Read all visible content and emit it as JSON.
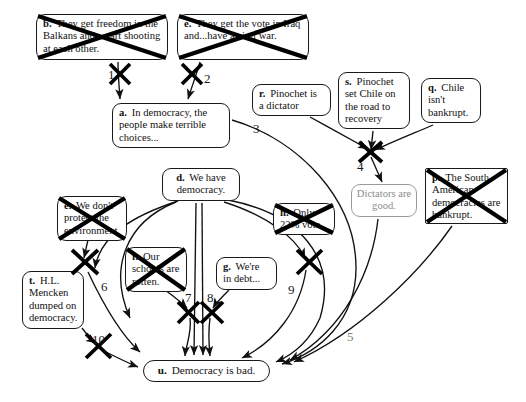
{
  "diagram": {
    "canvas": {
      "width": 526,
      "height": 402
    },
    "colors": {
      "ink": "#111111",
      "line": "#1a1a1a",
      "muted": "#8c8c8c",
      "background": "#ffffff"
    },
    "nodes": [
      {
        "id": "b",
        "label": "b.",
        "text": "They get freedom in the Balkans and...start shooting at each other.",
        "shape": "rounded",
        "refuted": true,
        "muted": false,
        "x": 36,
        "y": 14,
        "w": 132,
        "h": 46,
        "font": 10.6
      },
      {
        "id": "e_top",
        "label": "e.",
        "text": "They get the vote in Iraq and...have a civil war.",
        "shape": "rounded",
        "refuted": true,
        "muted": false,
        "x": 177,
        "y": 14,
        "w": 132,
        "h": 46,
        "font": 10.6
      },
      {
        "id": "a",
        "label": "a.",
        "text": "In democracy, the people make terrible choices...",
        "shape": "rounded",
        "refuted": false,
        "muted": false,
        "x": 112,
        "y": 103,
        "w": 118,
        "h": 45,
        "font": 10.6
      },
      {
        "id": "r",
        "label": "r.",
        "text": "Pinochet is a dictator",
        "shape": "rounded",
        "refuted": false,
        "muted": false,
        "x": 252,
        "y": 84,
        "w": 79,
        "h": 32,
        "font": 10.6
      },
      {
        "id": "s",
        "label": "s.",
        "text": "Pinochet set Chile on the road to recovery",
        "shape": "rounded",
        "refuted": false,
        "muted": false,
        "x": 338,
        "y": 72,
        "w": 72,
        "h": 57,
        "font": 10.6
      },
      {
        "id": "q",
        "label": "q.",
        "text": "Chile isn't bankrupt.",
        "shape": "rounded",
        "refuted": false,
        "muted": false,
        "x": 421,
        "y": 78,
        "w": 60,
        "h": 45,
        "font": 10.6
      },
      {
        "id": "dictators",
        "label": "",
        "text": "Dictators are good.",
        "shape": "rounded",
        "refuted": false,
        "muted": true,
        "x": 351,
        "y": 184,
        "w": 66,
        "h": 33,
        "font": 10.6
      },
      {
        "id": "p",
        "label": "p.",
        "text": "The South American democracies are bankrupt.",
        "shape": "rect",
        "refuted": true,
        "muted": false,
        "x": 425,
        "y": 168,
        "w": 83,
        "h": 56,
        "font": 10.6
      },
      {
        "id": "d",
        "label": "d.",
        "text": "We have democracy.",
        "shape": "rounded",
        "refuted": false,
        "muted": false,
        "x": 162,
        "y": 168,
        "w": 78,
        "h": 33,
        "font": 10.6
      },
      {
        "id": "e_left",
        "label": "e.",
        "text": "We don't protect the environment.",
        "shape": "rounded",
        "refuted": true,
        "muted": false,
        "x": 57,
        "y": 196,
        "w": 70,
        "h": 45,
        "font": 10.6
      },
      {
        "id": "f",
        "label": "f.",
        "text": "Our schools are rotten.",
        "shape": "rounded",
        "refuted": true,
        "muted": false,
        "x": 125,
        "y": 247,
        "w": 62,
        "h": 45,
        "font": 10.6
      },
      {
        "id": "g",
        "label": "g.",
        "text": "We're in debt...",
        "shape": "rounded",
        "refuted": false,
        "muted": false,
        "x": 216,
        "y": 257,
        "w": 61,
        "h": 33,
        "font": 10.6
      },
      {
        "id": "h",
        "label": "h.",
        "text": "Only 22% vote.",
        "shape": "rounded",
        "refuted": true,
        "muted": false,
        "x": 273,
        "y": 203,
        "w": 62,
        "h": 32,
        "font": 10.6
      },
      {
        "id": "t",
        "label": "t.",
        "text": "H.L. Mencken dumped on democracy.",
        "shape": "rounded",
        "refuted": false,
        "muted": false,
        "x": 22,
        "y": 271,
        "w": 62,
        "h": 58,
        "font": 10.6
      },
      {
        "id": "u",
        "label": "u.",
        "text": "Democracy is bad.",
        "shape": "pill",
        "refuted": false,
        "muted": false,
        "x": 143,
        "y": 360,
        "w": 127,
        "h": 22,
        "font": 11.2
      }
    ],
    "edge_labels": [
      {
        "id": "n1",
        "text": "1",
        "x": 108,
        "y": 68,
        "muted": false
      },
      {
        "id": "n2",
        "text": "2",
        "x": 204,
        "y": 72,
        "muted": false
      },
      {
        "id": "n3",
        "text": "3",
        "x": 253,
        "y": 122,
        "muted": false
      },
      {
        "id": "n4",
        "text": "4",
        "x": 357,
        "y": 160,
        "muted": false
      },
      {
        "id": "n5",
        "text": "5",
        "x": 347,
        "y": 330,
        "muted": true
      },
      {
        "id": "n6",
        "text": "6",
        "x": 101,
        "y": 280,
        "muted": false
      },
      {
        "id": "n7",
        "text": "7",
        "x": 185,
        "y": 291,
        "muted": false
      },
      {
        "id": "n8",
        "text": "8",
        "x": 207,
        "y": 291,
        "muted": false
      },
      {
        "id": "n9",
        "text": "9",
        "x": 288,
        "y": 283,
        "muted": false
      },
      {
        "id": "n10",
        "text": "10",
        "x": 92,
        "y": 333,
        "muted": false
      }
    ],
    "refutation_marks": [
      {
        "id": "x1",
        "x": 120,
        "y": 73,
        "size": 22
      },
      {
        "id": "x2",
        "x": 192,
        "y": 73,
        "size": 22
      },
      {
        "id": "x4",
        "x": 370,
        "y": 152,
        "size": 24
      },
      {
        "id": "x6",
        "x": 85,
        "y": 262,
        "size": 26
      },
      {
        "id": "x7",
        "x": 188,
        "y": 312,
        "size": 22
      },
      {
        "id": "x8",
        "x": 212,
        "y": 312,
        "size": 22
      },
      {
        "id": "x9",
        "x": 310,
        "y": 262,
        "size": 24
      },
      {
        "id": "x10",
        "x": 98,
        "y": 346,
        "size": 24
      }
    ]
  }
}
